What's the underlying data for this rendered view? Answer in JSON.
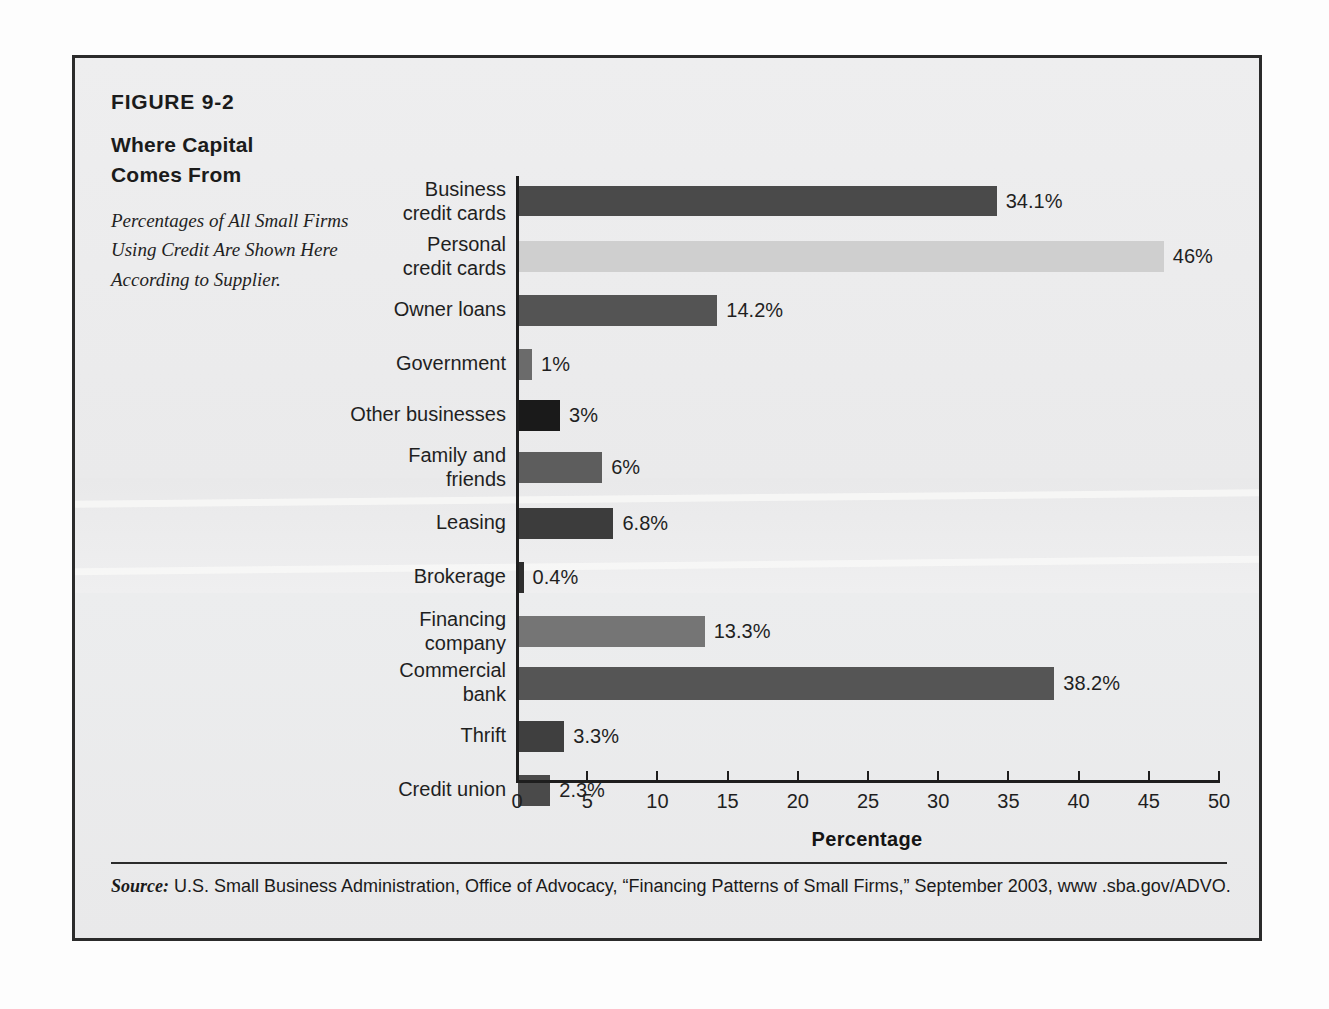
{
  "figure": {
    "number": "FIGURE 9-2",
    "title_lines": [
      "Where Capital",
      "Comes From"
    ],
    "description": "Percentages of All Small Firms Using Credit Are Shown Here According to Supplier.",
    "source_prefix": "Source:",
    "source_text": " U.S. Small Business Administration, Office of Advocacy, “Financing Patterns of Small Firms,” September 2003, www .sba.gov/ADVO."
  },
  "colors": {
    "page_background": "#fdfdfd",
    "panel_background": "#ececed",
    "frame_border": "#2b2b2b",
    "axis": "#1e1e1e",
    "text": "#1f1f1f"
  },
  "chart_data": {
    "type": "bar",
    "orientation": "horizontal",
    "title": "Where Capital Comes From",
    "subtitle": "Percentages of All Small Firms Using Credit Are Shown Here According to Supplier.",
    "xlabel": "Percentage",
    "ylabel": "",
    "xlim": [
      0,
      50
    ],
    "xticks": [
      0,
      5,
      10,
      15,
      20,
      25,
      30,
      35,
      40,
      45,
      50
    ],
    "xtick_labels": [
      "0",
      "5",
      "10",
      "15",
      "20",
      "25",
      "30",
      "35",
      "40",
      "45",
      "50"
    ],
    "grid": false,
    "legend": "none",
    "categories": [
      "Business credit cards",
      "Personal credit cards",
      "Owner loans",
      "Government",
      "Other businesses",
      "Family and friends",
      "Leasing",
      "Brokerage",
      "Financing company",
      "Commercial bank",
      "Thrift",
      "Credit union"
    ],
    "values": [
      34.1,
      46,
      14.2,
      1,
      3,
      6,
      6.8,
      0.4,
      13.3,
      38.2,
      3.3,
      2.3
    ],
    "value_labels": [
      "34.1%",
      "46%",
      "14.2%",
      "1%",
      "3%",
      "6%",
      "6.8%",
      "0.4%",
      "13.3%",
      "38.2%",
      "3.3%",
      "2.3%"
    ],
    "bar_colors": [
      "#4a4a4a",
      "#cfcfcf",
      "#545454",
      "#6b6b6b",
      "#1a1a1a",
      "#5d5d5d",
      "#3c3c3c",
      "#2e2e2e",
      "#757575",
      "#555555",
      "#3f3f3f",
      "#4a4a4a"
    ]
  },
  "bars": [
    {
      "label_lines": [
        "Business",
        "credit cards"
      ],
      "value": 34.1,
      "value_label": "34.1%",
      "color": "#4a4a4a",
      "top": 128,
      "height": 30
    },
    {
      "label_lines": [
        "Personal",
        "credit cards"
      ],
      "value": 46,
      "value_label": "46%",
      "color": "#cfcfcf",
      "top": 183,
      "height": 31
    },
    {
      "label_lines": [
        "Owner loans"
      ],
      "value": 14.2,
      "value_label": "14.2%",
      "color": "#545454",
      "top": 237,
      "height": 31
    },
    {
      "label_lines": [
        "Government"
      ],
      "value": 1,
      "value_label": "1%",
      "color": "#6b6b6b",
      "top": 291,
      "height": 31
    },
    {
      "label_lines": [
        "Other businesses"
      ],
      "value": 3,
      "value_label": "3%",
      "color": "#1a1a1a",
      "top": 342,
      "height": 31
    },
    {
      "label_lines": [
        "Family and",
        "friends"
      ],
      "value": 6,
      "value_label": "6%",
      "color": "#5d5d5d",
      "top": 394,
      "height": 31
    },
    {
      "label_lines": [
        "Leasing"
      ],
      "value": 6.8,
      "value_label": "6.8%",
      "color": "#3c3c3c",
      "top": 450,
      "height": 31
    },
    {
      "label_lines": [
        "Brokerage"
      ],
      "value": 0.4,
      "value_label": "0.4%",
      "color": "#2e2e2e",
      "top": 504,
      "height": 31
    },
    {
      "label_lines": [
        "Financing",
        "company"
      ],
      "value": 13.3,
      "value_label": "13.3%",
      "color": "#757575",
      "top": 558,
      "height": 31
    },
    {
      "label_lines": [
        "Commercial",
        "bank"
      ],
      "value": 38.2,
      "value_label": "38.2%",
      "color": "#555555",
      "top": 609,
      "height": 33
    },
    {
      "label_lines": [
        "Thrift"
      ],
      "value": 3.3,
      "value_label": "3.3%",
      "color": "#3f3f3f",
      "top": 663,
      "height": 31
    },
    {
      "label_lines": [
        "Credit union"
      ],
      "value": 2.3,
      "value_label": "2.3%",
      "color": "#4a4a4a",
      "top": 717,
      "height": 31
    }
  ],
  "axis": {
    "x_title": "Percentage",
    "ticks": [
      "0",
      "5",
      "10",
      "15",
      "20",
      "25",
      "30",
      "35",
      "40",
      "45",
      "50"
    ]
  }
}
